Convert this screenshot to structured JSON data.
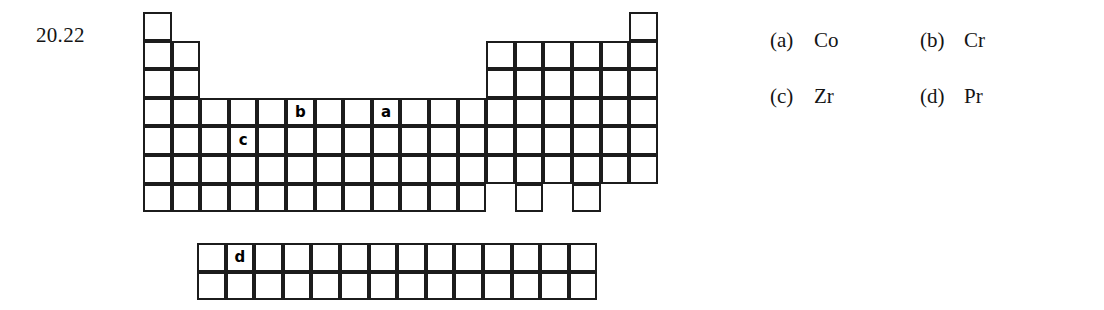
{
  "question": {
    "number": "20.22"
  },
  "figure": {
    "name": "periodic-table-outline",
    "cell_size": 28.6,
    "origin": {
      "x": 143,
      "y": 12
    },
    "main_block": {
      "columns": 18,
      "rows": 7,
      "row_spans": [
        {
          "row": 1,
          "spans": [
            [
              1,
              1
            ],
            [
              18,
              18
            ]
          ]
        },
        {
          "row": 2,
          "spans": [
            [
              1,
              2
            ],
            [
              13,
              18
            ]
          ]
        },
        {
          "row": 3,
          "spans": [
            [
              1,
              2
            ],
            [
              13,
              18
            ]
          ]
        },
        {
          "row": 4,
          "spans": [
            [
              1,
              18
            ]
          ]
        },
        {
          "row": 5,
          "spans": [
            [
              1,
              18
            ]
          ]
        },
        {
          "row": 6,
          "spans": [
            [
              1,
              18
            ]
          ]
        },
        {
          "row": 7,
          "spans": [
            [
              1,
              12
            ],
            [
              14,
              14
            ],
            [
              16,
              16
            ]
          ]
        }
      ]
    },
    "inner_block": {
      "columns": 14,
      "rows": 2,
      "origin": {
        "x": 197,
        "y": 243
      }
    },
    "markers": [
      {
        "id": "a",
        "label": "a",
        "block": "main",
        "row": 4,
        "col": 9
      },
      {
        "id": "b",
        "label": "b",
        "block": "main",
        "row": 4,
        "col": 6
      },
      {
        "id": "c",
        "label": "c",
        "block": "main",
        "row": 5,
        "col": 4
      },
      {
        "id": "d",
        "label": "d",
        "block": "inner",
        "row": 1,
        "col": 2
      }
    ]
  },
  "options": [
    {
      "key": "(a)",
      "value": "Co"
    },
    {
      "key": "(b)",
      "value": "Cr"
    },
    {
      "key": "(c)",
      "value": "Zr"
    },
    {
      "key": "(d)",
      "value": "Pr"
    }
  ]
}
